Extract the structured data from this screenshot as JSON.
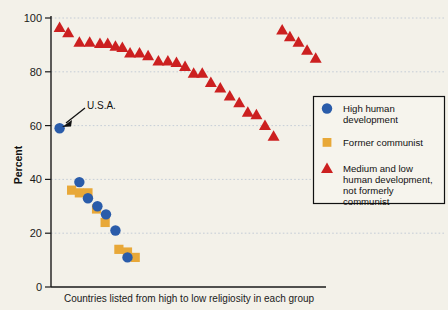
{
  "chart_data": {
    "type": "scatter",
    "title": "",
    "xlabel": "Countries listed from high to low religiosity in each group",
    "ylabel": "Percent",
    "ylim": [
      0,
      100
    ],
    "yticks": [
      0,
      20,
      40,
      60,
      80,
      100
    ],
    "ytick_labels": [
      "0",
      "20",
      "40",
      "60",
      "80",
      "100"
    ],
    "xlim": [
      0,
      32
    ],
    "xticks": [],
    "grid": "horizontal-dotted",
    "legend_position": "right",
    "annotations": [
      {
        "text": "U.S.A.",
        "series": "High human development",
        "point_index": 0,
        "value": 59
      }
    ],
    "series": [
      {
        "name": "High human development",
        "marker": "circle",
        "color": "#2a5caa",
        "x": [
          1.0,
          3.3,
          4.3,
          5.4,
          6.4,
          7.5,
          8.9
        ],
        "values": [
          59,
          39,
          33,
          30,
          27,
          21,
          11
        ]
      },
      {
        "name": "Former communist",
        "marker": "square",
        "color": "#e8a838",
        "x": [
          2.4,
          3.3,
          4.3,
          5.3,
          6.3,
          7.9,
          8.9,
          9.8
        ],
        "values": [
          36,
          35,
          35,
          29,
          24,
          14,
          13,
          11
        ]
      },
      {
        "name": "Medium and low human development, not formerly communist",
        "marker": "triangle",
        "color": "#cc2020",
        "x": [
          1.0,
          2.0,
          3.3,
          4.5,
          5.7,
          6.6,
          7.5,
          8.3,
          9.2,
          10.3,
          11.3,
          12.5,
          13.6,
          14.6,
          15.6,
          16.6,
          17.6,
          18.6,
          19.7,
          20.8,
          21.9,
          22.9,
          23.9,
          24.9,
          25.9,
          26.9,
          27.8,
          28.8,
          29.8,
          30.8
        ],
        "values": [
          96.5,
          94.5,
          91,
          91,
          90.5,
          90.5,
          89.5,
          89,
          87,
          87,
          86,
          84,
          84,
          83.5,
          82,
          79.5,
          79.5,
          76,
          74,
          71,
          68.5,
          65,
          64,
          60,
          56,
          95.5,
          93,
          91,
          88,
          85
        ]
      }
    ]
  },
  "legend": {
    "items": [
      {
        "label_line1": "High human",
        "label_line2": "development",
        "label_line3": "",
        "label_line4": "",
        "marker": "circle-marker",
        "color": "#2a5caa"
      },
      {
        "label_line1": "Former communist",
        "label_line2": "",
        "label_line3": "",
        "label_line4": "",
        "marker": "square-marker",
        "color": "#e8a838"
      },
      {
        "label_line1": "Medium and low",
        "label_line2": "human development,",
        "label_line3": "not formerly",
        "label_line4": "communist",
        "marker": "triangle-marker",
        "color": "#cc2020"
      }
    ]
  },
  "axes": {
    "y_title": "Percent",
    "x_title": "Countries listed from high to low religiosity in each group",
    "y_tick_0": "0",
    "y_tick_20": "20",
    "y_tick_40": "40",
    "y_tick_60": "60",
    "y_tick_80": "80",
    "y_tick_100": "100"
  },
  "annotation": {
    "usa_label": "U.S.A."
  }
}
